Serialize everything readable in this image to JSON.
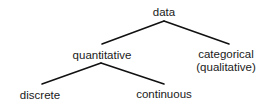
{
  "diagram": {
    "type": "tree",
    "nodes": {
      "data": {
        "label": "data"
      },
      "quantitative": {
        "label": "quantitative"
      },
      "categorical": {
        "line1": "categorical",
        "line2": "(qualitative)"
      },
      "discrete": {
        "label": "discrete"
      },
      "continuous": {
        "label": "continuous"
      }
    },
    "edges": [
      {
        "from": "data",
        "to": "quantitative"
      },
      {
        "from": "data",
        "to": "categorical"
      },
      {
        "from": "quantitative",
        "to": "discrete"
      },
      {
        "from": "quantitative",
        "to": "continuous"
      }
    ],
    "line_color": "#111111",
    "text_color": "#1a1a1a"
  }
}
